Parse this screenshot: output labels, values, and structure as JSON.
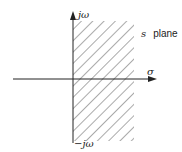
{
  "diagram": {
    "title": "s plane",
    "axes": {
      "vertical_top_label": "jω",
      "vertical_bottom_label": "−jω",
      "horizontal_label": "σ"
    },
    "region": {
      "description": "right half-plane shaded with diagonal hatching",
      "hatch_color": "#555555"
    },
    "plane_label": {
      "variable": "s",
      "word": "plane"
    }
  }
}
